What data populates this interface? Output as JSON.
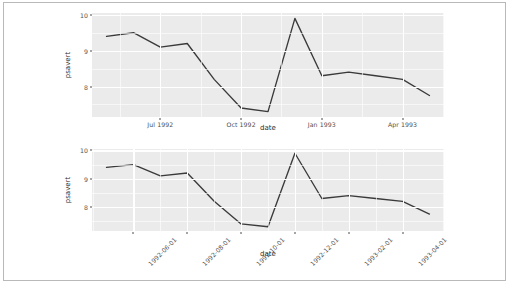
{
  "figure": {
    "background_color": "#FFFFFF",
    "border_color": "#B9B9B9",
    "panel_background": "#EBEBEB",
    "gridline_color": "#FFFFFF",
    "line_color": "#3A3A3A"
  },
  "chart_data": [
    {
      "type": "line",
      "id": "top-panel",
      "title": "",
      "xlabel": "date",
      "ylabel": "psavert",
      "ylim": [
        7.15,
        10.05
      ],
      "grid": true,
      "legend": "none",
      "x_tick_format": "Mon YYYY",
      "x_tick_labels": [
        "Jul 1992",
        "Oct 1992",
        "Jan 1993",
        "Apr 1993"
      ],
      "x_tick_dates": [
        "1992-07-01",
        "1992-10-01",
        "1993-01-01",
        "1993-04-01"
      ],
      "y_tick_labels": [
        "8",
        "9",
        "10"
      ],
      "y_ticks": [
        8,
        9,
        10
      ],
      "x": [
        "1992-05-01",
        "1992-06-01",
        "1992-07-01",
        "1992-08-01",
        "1992-09-01",
        "1992-10-01",
        "1992-11-01",
        "1992-12-01",
        "1993-01-01",
        "1993-02-01",
        "1993-03-01",
        "1993-04-01",
        "1993-05-01"
      ],
      "values": [
        9.4,
        9.5,
        9.1,
        9.2,
        8.2,
        7.4,
        7.3,
        9.9,
        8.3,
        8.4,
        8.3,
        8.2,
        7.75
      ]
    },
    {
      "type": "line",
      "id": "bottom-panel",
      "title": "",
      "xlabel": "date",
      "ylabel": "psavert",
      "ylim": [
        7.15,
        10.05
      ],
      "grid": true,
      "legend": "none",
      "x_tick_format": "YYYY-MM-DD",
      "x_tick_labels": [
        "1992-06-01",
        "1992-08-01",
        "1992-10-01",
        "1992-12-01",
        "1993-02-01",
        "1993-04-01"
      ],
      "x_tick_dates": [
        "1992-06-01",
        "1992-08-01",
        "1992-10-01",
        "1992-12-01",
        "1993-02-01",
        "1993-04-01"
      ],
      "x_tick_label_rotation": -45,
      "y_tick_labels": [
        "8",
        "9",
        "10"
      ],
      "y_ticks": [
        8,
        9,
        10
      ],
      "x": [
        "1992-05-01",
        "1992-06-01",
        "1992-07-01",
        "1992-08-01",
        "1992-09-01",
        "1992-10-01",
        "1992-11-01",
        "1992-12-01",
        "1993-01-01",
        "1993-02-01",
        "1993-03-01",
        "1993-04-01",
        "1993-05-01"
      ],
      "values": [
        9.4,
        9.5,
        9.1,
        9.2,
        8.2,
        7.4,
        7.3,
        9.9,
        8.3,
        8.4,
        8.3,
        8.2,
        7.75
      ]
    }
  ]
}
